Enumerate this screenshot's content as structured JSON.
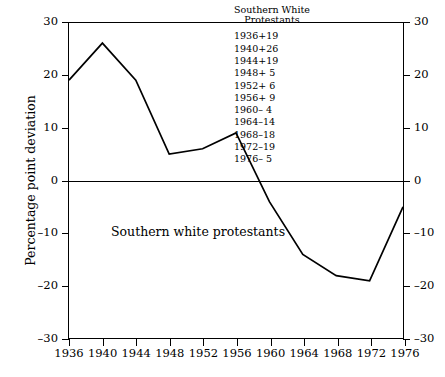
{
  "chart_data": {
    "type": "line",
    "title": "",
    "xlabel": "",
    "ylabel": "Percentage point deviation",
    "x": [
      1936,
      1940,
      1944,
      1948,
      1952,
      1956,
      1960,
      1964,
      1968,
      1972,
      1976
    ],
    "values": [
      19,
      26,
      19,
      5,
      6,
      9,
      -4,
      -14,
      -18,
      -19,
      -5
    ],
    "series": [
      {
        "name": "Southern White Protestants",
        "values": [
          19,
          26,
          19,
          5,
          6,
          9,
          -4,
          -14,
          -18,
          -19,
          -5
        ]
      }
    ],
    "xlim": [
      1936,
      1976
    ],
    "ylim": [
      -30,
      30
    ],
    "yticks": [
      30,
      20,
      10,
      0,
      -10,
      -20,
      -30
    ],
    "ytick_labels": [
      "30",
      "20",
      "10",
      "0",
      "-10",
      "-20",
      "-30"
    ],
    "xticks": [
      1936,
      1940,
      1944,
      1948,
      1952,
      1956,
      1960,
      1964,
      1968,
      1972,
      1976
    ],
    "xtick_labels": [
      "1936",
      "1940",
      "1944",
      "1948",
      "1952",
      "1956",
      "1960",
      "1964",
      "1968",
      "1972",
      "1976"
    ],
    "grid": false,
    "legend_position": "top-right",
    "zero_reference_line": 0,
    "annotations": [
      {
        "text": "Southern white protestants",
        "x": 1944,
        "y": -13
      }
    ],
    "line_color": "#000000"
  },
  "legend": {
    "title_line1": "Southern White",
    "title_line2": "Protestants",
    "rows": [
      {
        "year": "1936",
        "value": "+19"
      },
      {
        "year": "1940",
        "value": "+26"
      },
      {
        "year": "1944",
        "value": "+19"
      },
      {
        "year": "1948",
        "value": "+ 5"
      },
      {
        "year": "1952",
        "value": "+ 6"
      },
      {
        "year": "1956",
        "value": "+ 9"
      },
      {
        "year": "1960",
        "value": "– 4"
      },
      {
        "year": "1964",
        "value": "–14"
      },
      {
        "year": "1968",
        "value": "–18"
      },
      {
        "year": "1972",
        "value": "–19"
      },
      {
        "year": "1976",
        "value": "– 5"
      }
    ]
  },
  "annotation": {
    "series_label": "Southern white protestants"
  },
  "axes": {
    "y_title": "Percentage point deviation"
  }
}
